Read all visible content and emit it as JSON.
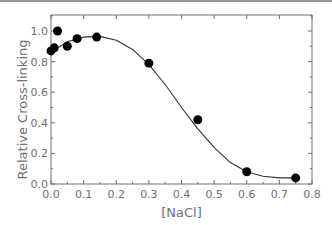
{
  "chart_data": {
    "type": "scatter",
    "title": "",
    "xlabel": "[NaCl]",
    "ylabel": "Relative Cross-linking",
    "xlim": [
      0.0,
      0.8
    ],
    "ylim": [
      0.0,
      1.1
    ],
    "xticks": [
      "0.0",
      "0.1",
      "0.2",
      "0.3",
      "0.4",
      "0.5",
      "0.6",
      "0.7",
      "0.8"
    ],
    "yticks": [
      "0.0",
      "0.2",
      "0.4",
      "0.6",
      "0.8",
      "1.0"
    ],
    "grid": false,
    "legend": null,
    "series": [
      {
        "name": "data",
        "kind": "scatter",
        "marker": "filled-circle",
        "color": "#000000",
        "x": [
          0.0,
          0.01,
          0.02,
          0.05,
          0.08,
          0.14,
          0.3,
          0.45,
          0.6,
          0.75
        ],
        "y": [
          0.87,
          0.89,
          1.0,
          0.9,
          0.95,
          0.96,
          0.79,
          0.42,
          0.08,
          0.04
        ]
      },
      {
        "name": "fit",
        "kind": "line",
        "color": "#333333",
        "x": [
          0.0,
          0.05,
          0.1,
          0.15,
          0.2,
          0.25,
          0.3,
          0.35,
          0.4,
          0.45,
          0.5,
          0.55,
          0.6,
          0.65,
          0.7,
          0.75
        ],
        "y": [
          0.86,
          0.93,
          0.96,
          0.965,
          0.94,
          0.88,
          0.78,
          0.65,
          0.5,
          0.36,
          0.24,
          0.14,
          0.08,
          0.05,
          0.04,
          0.04
        ]
      }
    ]
  }
}
